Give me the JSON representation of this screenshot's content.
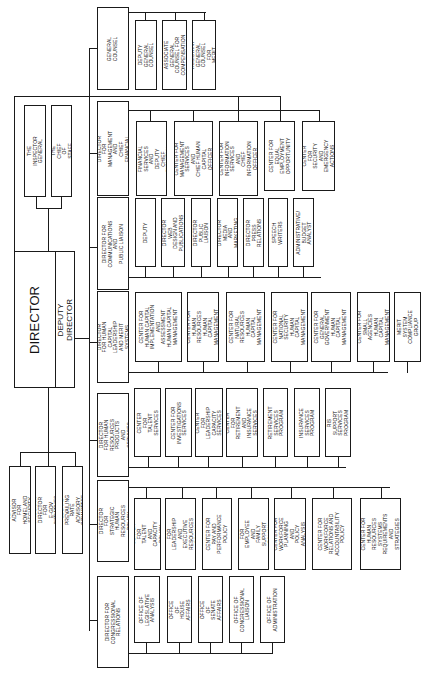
{
  "chart": {
    "orientation": "rotated 90 degrees clockwise (text reads bottom-to-top)",
    "director": {
      "label": "DIRECTOR"
    },
    "deputy_director": {
      "label": "DEPUTY DIRECTOR"
    },
    "staff_offices": [
      {
        "label": "THE INSPECTOR\nGENERAL"
      },
      {
        "label": "THE CHIEF OF\nSTAFF"
      }
    ],
    "advisors": [
      {
        "label": "SENIOR ADVISOR FOR\nHOMELAND SECURITY"
      },
      {
        "label": "PROGRAM DIRECTOR FOR\nE-GOV INITIATIVES"
      },
      {
        "label": "FEDERAL PREVAILING RATE\nADVISORY COMMITTEE"
      }
    ],
    "general_counsel": {
      "label": "GENERAL COUNSEL",
      "children": [
        {
          "label": "DEPUTY GENERAL\nCOUNSEL"
        },
        {
          "label": "ASSOCIATE GENERAL\nCOUNSEL FOR\nCOMPENSATION"
        },
        {
          "label": "ASSISTANT GENERAL\nCOUNSEL FOR\nMERIT"
        }
      ]
    },
    "divisions": [
      {
        "label": "ASSOCIATE DIRECTOR\nFOR MANAGEMENT AND\nCHIEF FINANCIAL OFFICER",
        "children": [
          {
            "label": "CENTER FOR\nFINANCIAL SERVICES\nAND DEPUTY CHIEF\nFINANCIAL OFFICER"
          },
          {
            "label": "CENTER FOR\nMANAGEMENT\nSERVICES AND\nCHIEF HUMAN\nCAPITAL OFFICER"
          },
          {
            "label": "CENTER FOR\nINFORMATION\nSERVICES AND\nCHIEF INFORMATION\nOFFICER"
          },
          {
            "label": "CENTER FOR\nEQUAL\nEMPLOYMENT\nOPPORTUNITY"
          },
          {
            "label": "CENTER FOR\nSECURITY AND\nEMERGENCY\nACTIONS"
          }
        ]
      },
      {
        "label": "DIRECTOR FOR\nCOMMUNICATIONS AND\nPUBLIC LIAISON",
        "children": [
          {
            "label": "DEPUTY"
          },
          {
            "label": "DIRECTOR WEB\nDESIGN AND\nPUBLICATIONS"
          },
          {
            "label": "DIRECTOR PUBLIC\nLIAISON"
          },
          {
            "label": "DIRECTOR MEDIA\nAND MARKETING"
          },
          {
            "label": "DIRECTOR PRESS\nRELATIONS"
          },
          {
            "label": "SPEECH WRITERS"
          },
          {
            "label": "ADMINISTRATIVE/\nBUDGET ANALYST"
          }
        ]
      },
      {
        "label": "ASSOCIATE DIRECTOR\nFOR HUMAN CAPITAL\nLEADERSHIP AND MERIT\nSYSTEMS ACCOUNTABILITY",
        "children": [
          {
            "label": "CENTER FOR\nHUMAN CAPITAL\nIMPLEMENTATION\nAND ASSESSMENT\nHUMAN CAPITAL\nMANAGEMENT"
          },
          {
            "label": "CENTER FOR\nHUMAN RESOURCES\nHUMAN CAPITAL\nMANAGEMENT"
          },
          {
            "label": "CENTER FOR\nNATURAL\nRESOURCES\nHUMAN CAPITAL\nMANAGEMENT"
          },
          {
            "label": "CENTER FOR\nNATIONAL SECURITY\nHUMAN CAPITAL\nMANAGEMENT"
          },
          {
            "label": "CENTER FOR\nGENERAL\nGOVERNMENT\nHUMAN CAPITAL\nMANAGEMENT"
          },
          {
            "label": "CENTER FOR\nSMALL AGENCIES\nHUMAN CAPITAL\nMANAGEMENT"
          },
          {
            "label": "MERIT SYSTEM\nCOMPLIANCE\nGROUP"
          }
        ]
      },
      {
        "label": "ASSOCIATE DIRECTOR\nFOR HUMAN RESOURCES\nPRODUCTS AND SERVICES",
        "children": [
          {
            "label": "CENTER FOR\nTALENT\nSERVICES"
          },
          {
            "label": "CENTER FOR\nINVESTIGATIONS\nSERVICES"
          },
          {
            "label": "CENTER FOR\nLEADERSHIP\nCAPACITY SERVICES"
          },
          {
            "label": "CENTER FOR\nRETIREMENT AND\nINSURANCE\nSERVICES"
          },
          {
            "label": "RETIREMENT\nSERVICES\nPROGRAM"
          },
          {
            "label": "INSURANCE\nSERVICES\nPROGRAM"
          },
          {
            "label": "RIS SUPPORT\nSERVICES\nPROGRAM"
          }
        ]
      },
      {
        "label": "ASSOCIATE DIRECTOR\nFOR STRATEGIC\nHUMAN RESOURCES POLICY",
        "children": [
          {
            "label": "CENTER FOR\nTALENT AND\nCAPACITY POLICY"
          },
          {
            "label": "CENTER FOR\nLEADERSHIP\nAND EXECUTIVE\nRESOURCES POLICY"
          },
          {
            "label": "CENTER FOR\nPAY AND\nPERFORMANCE\nPOLICY"
          },
          {
            "label": "CENTER FOR\nEMPLOYEE AND\nFAMILY SUPPORT\nPOLICY"
          },
          {
            "label": "CENTER FOR\nWORKFORCE\nPLANNING AND\nPOLICY ANALYSIS"
          },
          {
            "label": "CENTER FOR\nWORKFORCE\nRELATIONS AND\nACCOUNTABILITY\nPOLICY"
          },
          {
            "label": "CENTER FOR\nHUMAN RESOURCES\nSYSTEMS\nREQUIREMENTS\nAND STRATEGIES"
          }
        ]
      },
      {
        "label": "DIRECTOR FOR\nCONGRESSIONAL\nRELATIONS",
        "children": [
          {
            "label": "OFFICE OF\nLEGISLATIVE\nANALYSIS"
          },
          {
            "label": "OFFICE OF\nHOUSE\nAFFAIRS"
          },
          {
            "label": "OFFICE OF\nSENATE\nAFFAIRS"
          },
          {
            "label": "OFFICE OF\nCONGRESSIONAL\nLIAISON"
          },
          {
            "label": "OFFICE OF\nADMINISTRATION"
          }
        ]
      }
    ]
  }
}
